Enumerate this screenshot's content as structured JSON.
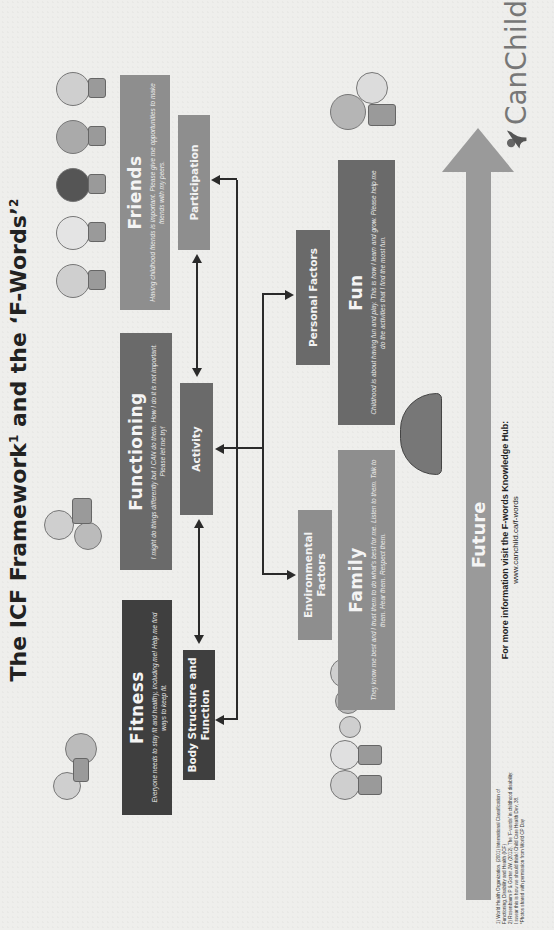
{
  "title": {
    "part1": "The ICF Framework",
    "sup1": "1",
    "part2": " and the ‘F-Words’",
    "sup2": "2"
  },
  "f_words": {
    "fitness": {
      "heading": "Fitness",
      "text": "Everyone needs to stay fit and healthy, including me! Help me find ways to keep fit."
    },
    "functioning": {
      "heading": "Functioning",
      "text": "I might do things differently but I CAN do them. How I do it is not important. Please let me try!"
    },
    "friends": {
      "heading": "Friends",
      "text": "Having childhood friends is important. Please give me opportunities to make friends with my peers."
    },
    "family": {
      "heading": "Family",
      "text": "They know me best and I trust them to do what's best for me. Listen to them. Talk to them. Hear them. Respect them."
    },
    "fun": {
      "heading": "Fun",
      "text": "Childhood is about having fun and play. This is how I learn and grow. Please help me do the activities that I find the most fun."
    },
    "future": {
      "heading": "Future"
    }
  },
  "icf": {
    "body_structure": "Body Structure and Function",
    "activity": "Activity",
    "participation": "Participation",
    "environmental": "Environmental Factors",
    "personal": "Personal Factors"
  },
  "footer": {
    "info": "For more information visit the F-words Knowledge Hub:",
    "url": "www.canchild.ca/f-words"
  },
  "logo": {
    "name": "CanChild"
  },
  "footnotes": [
    "1) World Health Organization. (2001) International Classification of",
    "Functioning, Disability and Health (ICF)",
    "2) Rosenbaum P & Gorter JW. (2012). The ‘F-words’ in childhood disability:",
    "I swear this is how we should think! Child Care Health Dev, 38.",
    "*Photos shared with permission from World CP Day"
  ],
  "colors": {
    "background": "#eeeeec",
    "dark_box": "#3f3f3f",
    "mid_box": "#7d7d7d",
    "future_arrow": "#9a9a9a",
    "text_dark": "#222222"
  }
}
